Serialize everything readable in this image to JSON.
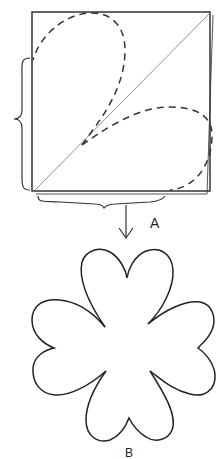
{
  "diagram": {
    "title": "",
    "labels": {
      "step_a": "A",
      "step_b": "B"
    },
    "elements": {
      "folded_square": "square paper folded along diagonal",
      "petal_outlines": "two dashed heart-petal outlines",
      "result_shape": "four-petal heart flower"
    },
    "colors": {
      "stroke": "#222222",
      "background": "#ffffff"
    }
  }
}
